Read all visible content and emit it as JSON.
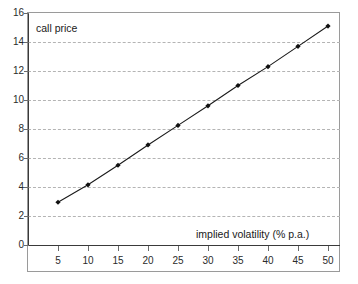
{
  "chart_data": {
    "type": "line",
    "title": "",
    "xlabel": "implied volatility (% p.a.)",
    "ylabel": "call price",
    "x": [
      5,
      10,
      15,
      20,
      25,
      30,
      35,
      40,
      45,
      50
    ],
    "values": [
      2.95,
      4.15,
      5.5,
      6.9,
      8.25,
      9.6,
      11.0,
      12.3,
      13.7,
      15.1
    ],
    "series": [
      {
        "name": "call price",
        "values": [
          2.95,
          4.15,
          5.5,
          6.9,
          8.25,
          9.6,
          11.0,
          12.3,
          13.7,
          15.1
        ]
      }
    ],
    "xlim": [
      0,
      52
    ],
    "ylim": [
      0,
      16
    ],
    "xticks": [
      "5",
      "10",
      "15",
      "20",
      "25",
      "30",
      "35",
      "40",
      "45",
      "50"
    ],
    "xtick_values": [
      5,
      10,
      15,
      20,
      25,
      30,
      35,
      40,
      45,
      50
    ],
    "yticks": [
      "0",
      "2",
      "4",
      "6",
      "8",
      "10",
      "12",
      "14",
      "16"
    ],
    "ytick_values": [
      0,
      2,
      4,
      6,
      8,
      10,
      12,
      14,
      16
    ],
    "grid": "horizontal-dashed",
    "legend": "none",
    "line_color": "#1a1a1a",
    "marker": "filled-diamond",
    "marker_color": "#111111",
    "gridline_color": "#b4b4b4",
    "axis_color": "#3a3a3a",
    "frame_color": "#9a9a9a",
    "background": "#ffffff"
  }
}
